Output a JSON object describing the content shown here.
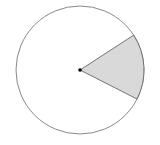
{
  "diagram": {
    "type": "circle-sector",
    "sector": {
      "start_angle_deg": -27,
      "end_angle_deg": 33,
      "central_angle_deg": 60,
      "fill": "#d9d9d9"
    },
    "circle_stroke": "#888888",
    "center_dot_color": "#000000"
  }
}
